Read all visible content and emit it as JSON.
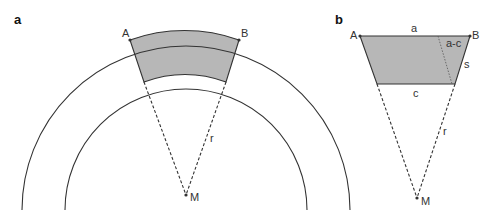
{
  "panel_a": {
    "label": "a",
    "points": {
      "A": "A",
      "B": "B",
      "M": "M"
    },
    "radius_label": "r",
    "colors": {
      "shade": "#b7b7b7",
      "stroke": "#333333"
    }
  },
  "panel_b": {
    "label": "b",
    "points": {
      "A": "A",
      "B": "B",
      "M": "M"
    },
    "side_labels": {
      "top": "a",
      "difference": "a-c",
      "slant": "s",
      "bottom": "c",
      "radius": "r"
    },
    "colors": {
      "shade": "#b7b7b7",
      "stroke": "#333333"
    }
  }
}
